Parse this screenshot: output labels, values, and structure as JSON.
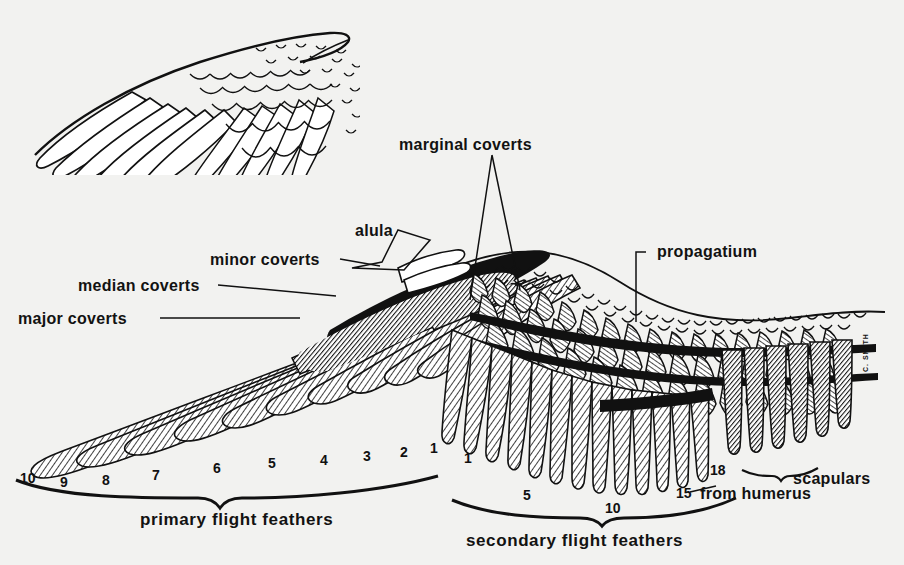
{
  "figure": {
    "background_color": "#f2f2f0",
    "ink_color": "#111111",
    "signature": "C. SMITH"
  },
  "inset": {
    "name": "wing-outline-inset",
    "caption": ""
  },
  "labels": [
    {
      "id": "major-coverts",
      "text": "major coverts",
      "x": 18,
      "y": 310,
      "leader": "line"
    },
    {
      "id": "median-coverts",
      "text": "median coverts",
      "x": 78,
      "y": 277,
      "leader": "line"
    },
    {
      "id": "minor-coverts",
      "text": "minor coverts",
      "x": 210,
      "y": 251,
      "leader": "line"
    },
    {
      "id": "alula",
      "text": "alula",
      "x": 355,
      "y": 222,
      "leader": "bracket"
    },
    {
      "id": "marginal-coverts",
      "text": "marginal coverts",
      "x": 399,
      "y": 136,
      "leader": "v-pointer"
    },
    {
      "id": "propagatium",
      "text": "propagatium",
      "x": 657,
      "y": 243,
      "leader": "elbow"
    },
    {
      "id": "scapulars",
      "text": "scapulars",
      "x": 793,
      "y": 470,
      "leader": "brace"
    },
    {
      "id": "from-humerus",
      "text": "from humerus",
      "x": 700,
      "y": 485,
      "leader": "none"
    }
  ],
  "braces": [
    {
      "id": "primary-brace",
      "label": "primary flight feathers",
      "label_x": 140,
      "label_y": 510
    },
    {
      "id": "secondary-brace",
      "label": "secondary flight feathers",
      "label_x": 466,
      "label_y": 531
    }
  ],
  "feather_numbers": {
    "primaries": [
      {
        "n": "10",
        "x": 20,
        "y": 470
      },
      {
        "n": "9",
        "x": 60,
        "y": 474
      },
      {
        "n": "8",
        "x": 102,
        "y": 472
      },
      {
        "n": "7",
        "x": 152,
        "y": 467
      },
      {
        "n": "6",
        "x": 213,
        "y": 460
      },
      {
        "n": "5",
        "x": 268,
        "y": 455
      },
      {
        "n": "4",
        "x": 320,
        "y": 452
      },
      {
        "n": "3",
        "x": 363,
        "y": 448
      },
      {
        "n": "2",
        "x": 400,
        "y": 444
      },
      {
        "n": "1",
        "x": 430,
        "y": 440
      }
    ],
    "secondaries": [
      {
        "n": "1",
        "x": 464,
        "y": 450
      },
      {
        "n": "5",
        "x": 523,
        "y": 487
      },
      {
        "n": "10",
        "x": 605,
        "y": 500
      },
      {
        "n": "15",
        "x": 676,
        "y": 485
      },
      {
        "n": "18",
        "x": 710,
        "y": 462
      }
    ]
  }
}
